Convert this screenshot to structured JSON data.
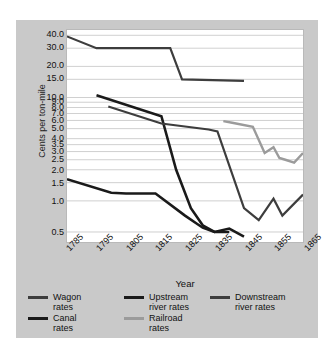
{
  "chart_data": {
    "type": "line",
    "title": "",
    "xlabel": "Year",
    "ylabel": "Cents per ton-mile",
    "yscale": "log",
    "ylim": [
      0.4,
      45.0
    ],
    "xlim": [
      1785,
      1865
    ],
    "grid": true,
    "legend_position": "bottom",
    "xticks": [
      1785,
      1795,
      1805,
      1815,
      1825,
      1835,
      1845,
      1855,
      1865
    ],
    "xtick_labels": [
      "1785",
      "1795",
      "1805",
      "1815",
      "1825",
      "1835",
      "1845",
      "1855",
      "1865"
    ],
    "yticks": [
      40.0,
      30.0,
      20.0,
      15.0,
      10.0,
      9.0,
      8.0,
      7.0,
      6.0,
      5.0,
      4.0,
      3.5,
      3.0,
      2.5,
      2.0,
      1.5,
      1.0,
      0.5
    ],
    "ytick_labels": [
      "40.0",
      "30.0",
      "20.0",
      "15.0",
      "10.0",
      "9.0",
      "8.0",
      "7.0",
      "6.0",
      "5.0",
      "4.0",
      "3.5",
      "3.0",
      "2.5",
      "2.0",
      "1.5",
      "1.0",
      "0.5"
    ],
    "series": [
      {
        "name": "Wagon rates",
        "color": "#3d3d3d",
        "width": 2.2,
        "x": [
          1785,
          1795,
          1820,
          1824,
          1845
        ],
        "values": [
          39.0,
          30.0,
          30.0,
          15.0,
          14.5
        ]
      },
      {
        "name": "Upstream river rates",
        "color": "#1a1a1a",
        "width": 2.6,
        "x": [
          1795,
          1817,
          1822,
          1827,
          1831,
          1835,
          1840,
          1845
        ],
        "values": [
          10.5,
          6.6,
          2.0,
          0.85,
          0.58,
          0.5,
          0.54,
          0.45
        ]
      },
      {
        "name": "Downstream river rates",
        "color": "#3d3d3d",
        "width": 2.2,
        "x": [
          1799,
          1817,
          1833,
          1836,
          1845,
          1850,
          1855,
          1858,
          1865
        ],
        "values": [
          8.2,
          5.6,
          4.9,
          4.7,
          0.85,
          0.65,
          1.05,
          0.72,
          1.15
        ]
      },
      {
        "name": "Canal rates",
        "color": "#1a1a1a",
        "width": 2.6,
        "x": [
          1785,
          1800,
          1805,
          1815,
          1825,
          1831,
          1835,
          1840
        ],
        "values": [
          1.62,
          1.2,
          1.18,
          1.18,
          0.72,
          0.55,
          0.5,
          0.5
        ]
      },
      {
        "name": "Railroad rates",
        "color": "#9b9b9b",
        "width": 2.4,
        "x": [
          1838,
          1841,
          1848,
          1852,
          1855,
          1857,
          1859,
          1862,
          1865
        ],
        "values": [
          5.9,
          5.7,
          5.2,
          2.9,
          3.3,
          2.6,
          2.5,
          2.35,
          2.9
        ]
      }
    ]
  },
  "legend": {
    "rows": [
      [
        {
          "label": "Wagon\nrates",
          "color": "#3d3d3d"
        },
        {
          "label": "Upstream\nriver rates",
          "color": "#1a1a1a"
        },
        {
          "label": "Downstream\nriver rates",
          "color": "#3d3d3d"
        }
      ],
      [
        {
          "label": "Canal\nrates",
          "color": "#1a1a1a"
        },
        {
          "label": "Railroad\nrates",
          "color": "#9b9b9b"
        }
      ]
    ]
  },
  "colors": {
    "figure_background": "#c9c9c9",
    "plot_background": "#ffffff",
    "gridline": "#c4c4c4",
    "text": "#111111"
  }
}
